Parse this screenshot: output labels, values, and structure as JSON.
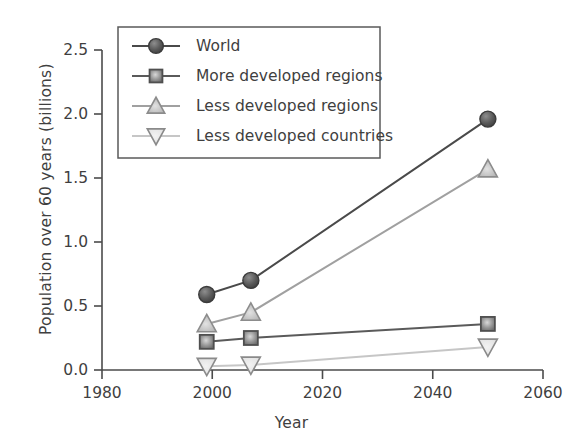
{
  "chart_data": {
    "type": "line",
    "title": "",
    "xlabel": "Year",
    "ylabel": "Population over 60 years  (billions)",
    "xlim": [
      1980,
      2060
    ],
    "ylim": [
      0.0,
      2.5
    ],
    "xticks": [
      "1980",
      "2000",
      "2020",
      "2040",
      "2060"
    ],
    "xtick_values": [
      1980,
      2000,
      2020,
      2040,
      2060
    ],
    "yticks": [
      "0.0",
      "0.5",
      "1.0",
      "1.5",
      "2.0",
      "2.5"
    ],
    "ytick_values": [
      0.0,
      0.5,
      1.0,
      1.5,
      2.0,
      2.5
    ],
    "grid": false,
    "legend_position": "upper left",
    "x": [
      1999,
      2007,
      2050
    ],
    "series": [
      {
        "name": "World",
        "marker": "circle",
        "color": "#4a4a4a",
        "line_color": "#4a4a4a",
        "values": [
          0.59,
          0.7,
          1.96
        ]
      },
      {
        "name": "More developed regions",
        "marker": "square",
        "color": "#7d7d7d",
        "line_color": "#5a5a5a",
        "values": [
          0.22,
          0.25,
          0.36
        ]
      },
      {
        "name": "Less developed regions",
        "marker": "triangle-up",
        "color": "#b5b5b5",
        "line_color": "#a0a0a0",
        "values": [
          0.36,
          0.45,
          1.57
        ]
      },
      {
        "name": "Less developed countries",
        "marker": "triangle-down",
        "color": "#d0d0d0",
        "line_color": "#c6c6c6",
        "values": [
          0.03,
          0.04,
          0.18
        ]
      }
    ]
  },
  "legend": {
    "items": [
      {
        "label": "World"
      },
      {
        "label": "More developed regions"
      },
      {
        "label": "Less developed regions"
      },
      {
        "label": "Less developed countries"
      }
    ]
  },
  "colors": {
    "axis": "#4b4b4b",
    "text": "#3f3f3f",
    "legend_border": "#5a5a5a",
    "background": "#ffffff"
  }
}
